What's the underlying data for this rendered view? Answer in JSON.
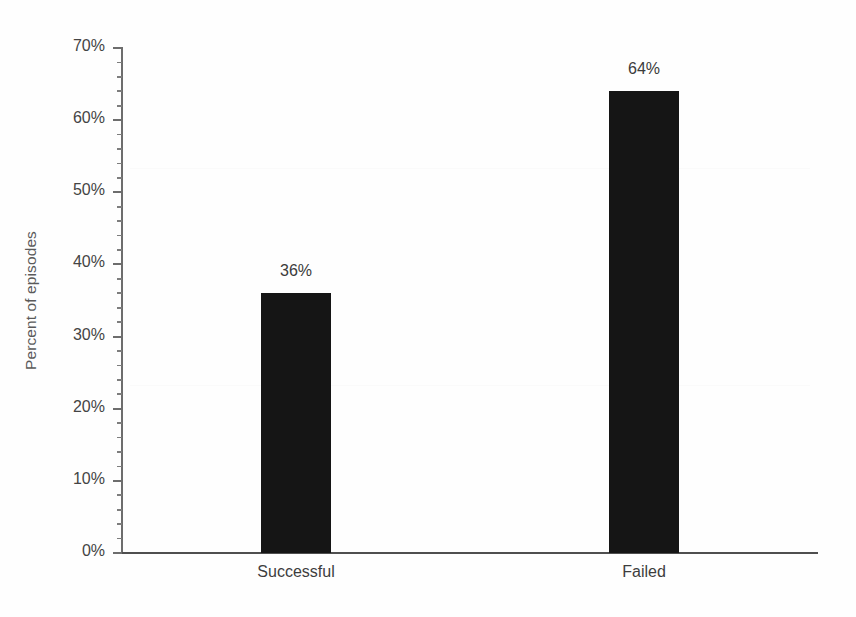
{
  "chart_data": {
    "type": "bar",
    "title": "",
    "subtitle": "",
    "xlabel": "",
    "ylabel": "Percent of episodes",
    "categories": [
      "Successful",
      "Failed"
    ],
    "values": [
      36,
      64
    ],
    "data_labels": [
      "36%",
      "64%"
    ],
    "ylim": [
      0,
      70
    ],
    "y_tick_labels": [
      "0%",
      "10%",
      "20%",
      "30%",
      "40%",
      "50%",
      "60%",
      "70%"
    ],
    "y_tick_values": [
      0,
      10,
      20,
      30,
      40,
      50,
      60,
      70
    ],
    "y_minor_tick_interval": 2,
    "grid": false,
    "legend": "none",
    "series": [
      {
        "name": "Percent of episodes",
        "color": "#151515",
        "values": [
          36,
          64
        ]
      }
    ]
  },
  "axes": {
    "y_title": "Percent of episodes",
    "axis_line_color": "#5f5f5f",
    "tick_label_color": "#444444"
  },
  "style": {
    "background": "#fefefe",
    "bar_color": "#151515",
    "data_label_color": "#3b3b3b",
    "category_label_color": "#3d3d3d",
    "y_title_color": "#5a5a5a"
  }
}
